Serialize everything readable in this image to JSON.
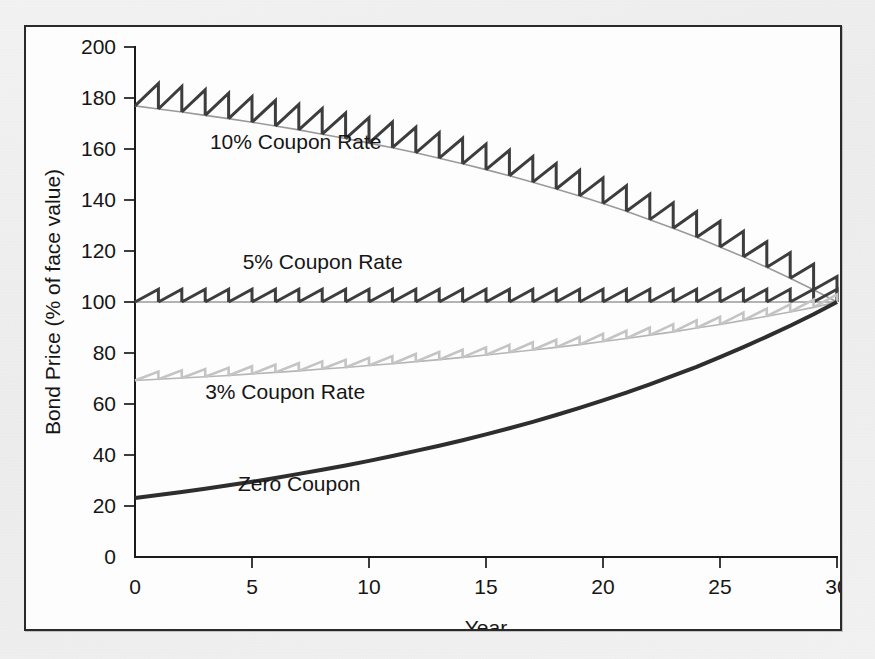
{
  "figure": {
    "border_color": "#2a2a2a",
    "background_color": "#fdfdfd",
    "page_background": "#f2f2f2"
  },
  "chart_data": {
    "type": "line",
    "title": "",
    "subtitle": "",
    "xlabel": "Year",
    "ylabel": "Bond Price (% of face value)",
    "xlim": [
      0,
      30
    ],
    "ylim": [
      0,
      200
    ],
    "xticks": [
      0,
      5,
      10,
      15,
      20,
      25,
      30
    ],
    "yticks": [
      0,
      20,
      40,
      60,
      80,
      100,
      120,
      140,
      160,
      180,
      200
    ],
    "xtick_labels": [
      "0",
      "5",
      "10",
      "15",
      "20",
      "25",
      "30"
    ],
    "ytick_labels": [
      "0",
      "20",
      "40",
      "60",
      "80",
      "100",
      "120",
      "140",
      "160",
      "180",
      "200"
    ],
    "grid": false,
    "legend_position": "inline-annotations",
    "face_value": 100,
    "maturity_years": 30,
    "yield_to_maturity_pct": 5,
    "note": "Bond price paths to maturity for four coupon rates at a 5% yield; sawtooth = accrued interest reset at each annual coupon payment; all converge to 100 at year 30.",
    "annotations": [
      {
        "text": "10% Coupon Rate",
        "x": 3.2,
        "y": 160,
        "color": "#3a3a3a"
      },
      {
        "text": "5% Coupon Rate",
        "x": 4.6,
        "y": 113,
        "color": "#3a3a3a"
      },
      {
        "text": "3% Coupon Rate",
        "x": 3.0,
        "y": 62,
        "color": "#3a3a3a"
      },
      {
        "text": "Zero Coupon",
        "x": 4.4,
        "y": 26,
        "color": "#3a3a3a"
      }
    ],
    "series": [
      {
        "name": "10% Coupon Rate",
        "coupon_rate_pct": 10,
        "color": "#3d3d3d",
        "trend_color": "#9a9a9a",
        "line_width": 3,
        "style": "sawtooth",
        "x": [
          0,
          1,
          2,
          3,
          4,
          5,
          6,
          7,
          8,
          9,
          10,
          11,
          12,
          13,
          14,
          15,
          16,
          17,
          18,
          19,
          20,
          21,
          22,
          23,
          24,
          25,
          26,
          27,
          28,
          29,
          30
        ],
        "values": [
          176.9,
          175.7,
          174.5,
          173.2,
          171.9,
          170.5,
          169.0,
          167.5,
          165.8,
          164.1,
          162.3,
          160.5,
          158.5,
          156.4,
          154.2,
          151.9,
          149.5,
          147.0,
          144.3,
          141.6,
          138.6,
          135.6,
          132.3,
          128.9,
          125.4,
          121.6,
          117.7,
          113.6,
          109.3,
          104.8,
          100.0
        ],
        "accrued_peak_values": [
          186.9,
          185.7,
          184.5,
          183.2,
          181.9,
          180.5,
          179.0,
          177.5,
          175.8,
          174.1,
          172.3,
          170.5,
          168.5,
          166.4,
          164.2,
          161.9,
          159.5,
          157.0,
          154.3,
          151.6,
          148.6,
          145.6,
          142.3,
          138.9,
          135.4,
          131.6,
          127.7,
          123.6,
          119.3,
          114.8,
          110.0
        ]
      },
      {
        "name": "5% Coupon Rate",
        "coupon_rate_pct": 5,
        "color": "#3d3d3d",
        "trend_color": "#9a9a9a",
        "line_width": 3,
        "style": "sawtooth",
        "x": [
          0,
          1,
          2,
          3,
          4,
          5,
          6,
          7,
          8,
          9,
          10,
          11,
          12,
          13,
          14,
          15,
          16,
          17,
          18,
          19,
          20,
          21,
          22,
          23,
          24,
          25,
          26,
          27,
          28,
          29,
          30
        ],
        "values": [
          100,
          100,
          100,
          100,
          100,
          100,
          100,
          100,
          100,
          100,
          100,
          100,
          100,
          100,
          100,
          100,
          100,
          100,
          100,
          100,
          100,
          100,
          100,
          100,
          100,
          100,
          100,
          100,
          100,
          100,
          100
        ],
        "accrued_peak_values": [
          105,
          105,
          105,
          105,
          105,
          105,
          105,
          105,
          105,
          105,
          105,
          105,
          105,
          105,
          105,
          105,
          105,
          105,
          105,
          105,
          105,
          105,
          105,
          105,
          105,
          105,
          105,
          105,
          105,
          105,
          105
        ]
      },
      {
        "name": "3% Coupon Rate",
        "coupon_rate_pct": 3,
        "color": "#c4c4c4",
        "trend_color": "#b5b5b5",
        "line_width": 2.6,
        "style": "sawtooth",
        "x": [
          0,
          1,
          2,
          3,
          4,
          5,
          6,
          7,
          8,
          9,
          10,
          11,
          12,
          13,
          14,
          15,
          16,
          17,
          18,
          19,
          20,
          21,
          22,
          23,
          24,
          25,
          26,
          27,
          28,
          29,
          30
        ],
        "values": [
          69.2,
          69.7,
          70.2,
          70.7,
          71.2,
          71.8,
          72.4,
          73.0,
          73.7,
          74.3,
          75.1,
          75.8,
          76.6,
          77.4,
          78.3,
          79.2,
          80.2,
          81.2,
          82.2,
          83.3,
          84.5,
          85.7,
          87.0,
          88.3,
          89.8,
          91.2,
          92.8,
          94.4,
          96.1,
          97.9,
          100.0
        ],
        "accrued_peak_values": [
          72.2,
          72.7,
          73.2,
          73.7,
          74.2,
          74.8,
          75.4,
          76.0,
          76.7,
          77.3,
          78.1,
          78.8,
          79.6,
          80.4,
          81.3,
          82.2,
          83.2,
          84.2,
          85.2,
          86.3,
          87.5,
          88.7,
          90.0,
          91.3,
          92.8,
          94.2,
          95.8,
          97.4,
          99.1,
          100.9,
          103.0
        ]
      },
      {
        "name": "Zero Coupon",
        "coupon_rate_pct": 0,
        "color": "#2e2e2e",
        "trend_color": "#2e2e2e",
        "line_width": 4,
        "style": "smooth",
        "x": [
          0,
          1,
          2,
          3,
          4,
          5,
          6,
          7,
          8,
          9,
          10,
          11,
          12,
          13,
          14,
          15,
          16,
          17,
          18,
          19,
          20,
          21,
          22,
          23,
          24,
          25,
          26,
          27,
          28,
          29,
          30
        ],
        "values": [
          23.1,
          24.3,
          25.5,
          26.8,
          28.1,
          29.5,
          31.0,
          32.6,
          34.2,
          35.9,
          37.7,
          39.6,
          41.6,
          43.6,
          45.8,
          48.1,
          50.5,
          53.0,
          55.7,
          58.5,
          61.4,
          64.5,
          67.7,
          71.1,
          74.6,
          78.4,
          82.3,
          86.4,
          90.7,
          95.2,
          100.0
        ]
      }
    ]
  }
}
